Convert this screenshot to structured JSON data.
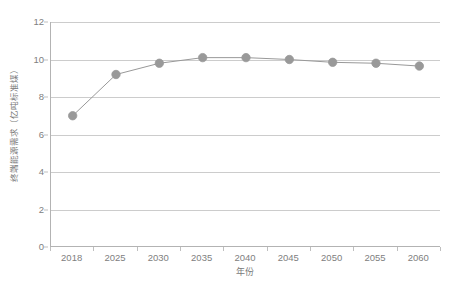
{
  "chart_data": {
    "type": "line",
    "title": "",
    "subtitle": "",
    "xlabel": "年份",
    "ylabel": "终端能源需求（亿吨标准煤）",
    "categories": [
      2018,
      2025,
      2030,
      2035,
      2040,
      2045,
      2050,
      2055,
      2060
    ],
    "x_tick_labels": [
      "2018",
      "2025",
      "2030",
      "2035",
      "2040",
      "2045",
      "2050",
      "2055",
      "2060"
    ],
    "values": [
      7.0,
      9.2,
      9.8,
      10.1,
      10.1,
      10.0,
      9.85,
      9.8,
      9.65
    ],
    "series": [
      {
        "name": "终端能源需求",
        "values": [
          7.0,
          9.2,
          9.8,
          10.1,
          10.1,
          10.0,
          9.85,
          9.8,
          9.65
        ],
        "marker": "circle",
        "color": "#999999"
      }
    ],
    "ylim": [
      0,
      12
    ],
    "y_tick_labels": [
      "0",
      "2",
      "4",
      "6",
      "8",
      "10",
      "12"
    ],
    "y_ticks": [
      0,
      2,
      4,
      6,
      8,
      10,
      12
    ],
    "grid": "horizontal",
    "legend": "none",
    "annotations": []
  },
  "style": {
    "line_color": "#999999",
    "marker_color": "#999999",
    "grid_color": "#cccccc",
    "axis_color": "#b3b3b3",
    "text_color": "#808080",
    "background": "#ffffff"
  }
}
